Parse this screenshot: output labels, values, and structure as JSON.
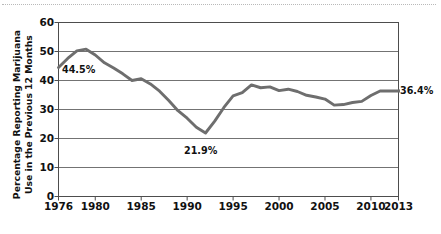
{
  "chart_data": {
    "type": "line",
    "title": "",
    "xlabel": "",
    "ylabel": "Percentage Reporting Marijuana\nUse in the Previous 12 Months",
    "xlim": [
      1976,
      2013
    ],
    "ylim": [
      0,
      60
    ],
    "grid": "horizontal",
    "legend": "none",
    "line_color": "#6e6e6e",
    "x_tick_labels": [
      "1976",
      "1980",
      "1985",
      "1990",
      "1995",
      "2000",
      "2005",
      "2010",
      "2013"
    ],
    "x_tick_values": [
      1976,
      1980,
      1985,
      1990,
      1995,
      2000,
      2005,
      2010,
      2013
    ],
    "y_tick_labels": [
      "0",
      "10",
      "20",
      "30",
      "40",
      "50",
      "60"
    ],
    "y_tick_values": [
      0,
      10,
      20,
      30,
      40,
      50,
      60
    ],
    "x": [
      1976,
      1977,
      1978,
      1979,
      1980,
      1981,
      1982,
      1983,
      1984,
      1985,
      1986,
      1987,
      1988,
      1989,
      1990,
      1991,
      1992,
      1993,
      1994,
      1995,
      1996,
      1997,
      1998,
      1999,
      2000,
      2001,
      2002,
      2003,
      2004,
      2005,
      2006,
      2007,
      2008,
      2009,
      2010,
      2011,
      2012,
      2013
    ],
    "values": [
      44.5,
      47.6,
      50.2,
      50.8,
      48.8,
      46.1,
      44.3,
      42.3,
      40.0,
      40.6,
      38.8,
      36.3,
      33.1,
      29.6,
      27.0,
      23.9,
      21.9,
      26.0,
      30.7,
      34.7,
      35.8,
      38.5,
      37.5,
      37.8,
      36.5,
      37.0,
      36.2,
      34.9,
      34.3,
      33.6,
      31.5,
      31.7,
      32.4,
      32.8,
      34.8,
      36.4,
      36.4,
      36.4
    ],
    "annotations": [
      {
        "name": "start-value",
        "label": "44.5%",
        "x": 1976,
        "y": 44.5
      },
      {
        "name": "minimum-value",
        "label": "21.9%",
        "x": 1992,
        "y": 21.9
      },
      {
        "name": "end-value",
        "label": "36.4%",
        "x": 2013,
        "y": 36.4
      }
    ]
  }
}
